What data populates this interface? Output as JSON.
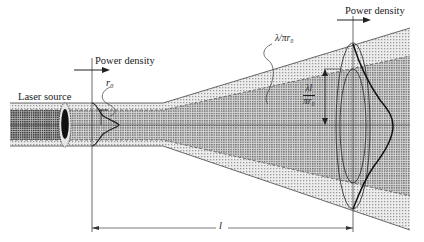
{
  "diagram": {
    "type": "laser beam divergence",
    "labels": {
      "source": "Laser source",
      "power_density_left": "Power density",
      "power_density_right": "Power density",
      "waist_radius": "r₀",
      "divergence_angle": "λ/πr₀",
      "spot_radius_num": "λl",
      "spot_radius_den": "πr₀",
      "distance": "l"
    },
    "colors": {
      "line": "#333333",
      "outer_shade": "#d6d6d6",
      "inner_shade": "#a8a8a8",
      "source_core": "#111111"
    }
  }
}
